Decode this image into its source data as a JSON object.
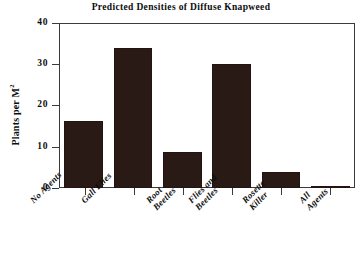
{
  "chart_data": {
    "type": "bar",
    "title": "Predicted Densities of Diffuse Knapweed",
    "xlabel": "",
    "ylabel": "Plants per M2",
    "ylabel_display": "Plants per M",
    "ylabel_superscript": "2",
    "categories": [
      "No Agents",
      "Gall Flies",
      "Root Beetles",
      "Flies and Beetles",
      "Rosette Killer",
      "All Agents"
    ],
    "category_lines": [
      [
        "No Agents",
        ""
      ],
      [
        "Gall Flies",
        ""
      ],
      [
        "Root",
        "Beetles"
      ],
      [
        "Flies and",
        "Beetles"
      ],
      [
        "Rosette",
        "Killer"
      ],
      [
        "All",
        "Agents"
      ]
    ],
    "values": [
      16.2,
      34.0,
      8.7,
      30.0,
      4.0,
      0.5
    ],
    "ylim": [
      0,
      40
    ],
    "yticks": [
      0,
      10,
      20,
      30,
      40
    ],
    "ytick_labels": [
      "0",
      "10",
      "20",
      "30",
      "40"
    ],
    "grid": false,
    "legend": null,
    "bar_color": "#2a1a16",
    "axis_color": "#3a3a3a",
    "background_color": "#ffffff"
  }
}
